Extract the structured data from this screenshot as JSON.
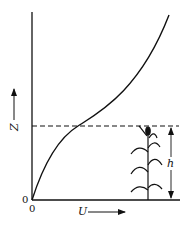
{
  "diagram": {
    "y_axis_label": "Z",
    "x_axis_label": "U",
    "origin_labels": [
      "0",
      "0"
    ],
    "canopy_height_label": "h",
    "curve": "velocity profile U(Z): concave near ground, inflection at canopy top, increasing above",
    "canopy_top_line": "dashed"
  },
  "colors": {
    "ink": "#111111",
    "background": "#ffffff"
  }
}
